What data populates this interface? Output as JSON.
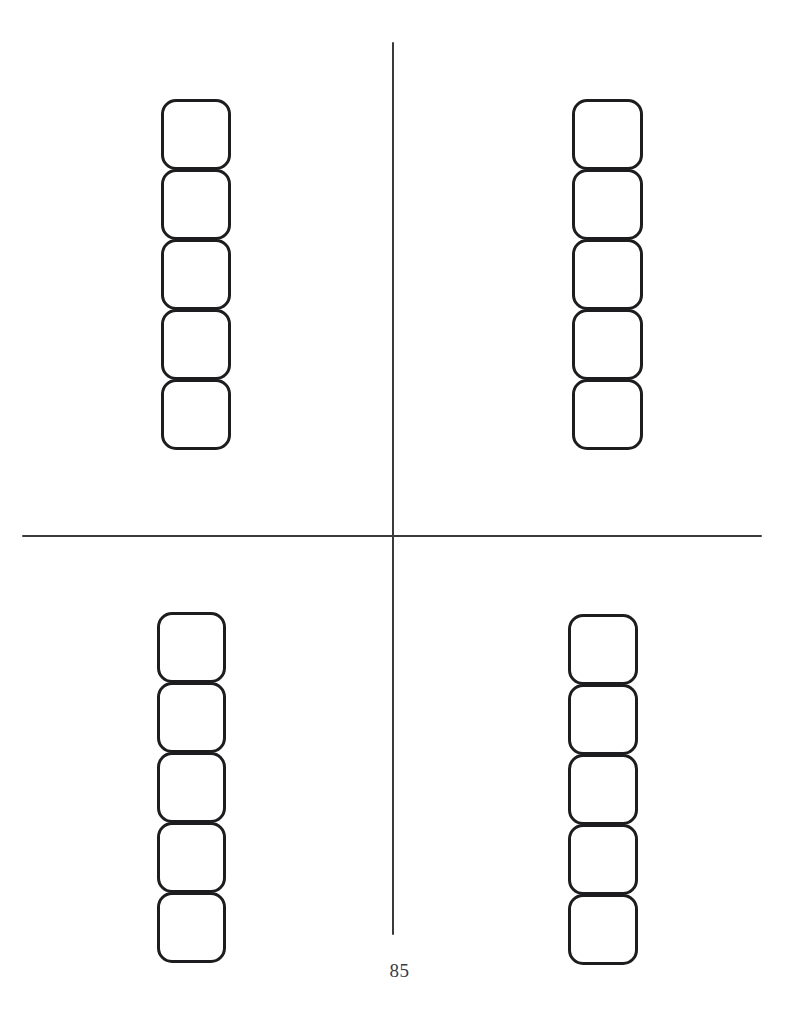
{
  "page": {
    "number": "85",
    "width": 799,
    "height": 1027,
    "background_color": "#ffffff"
  },
  "worksheet": {
    "type": "blank-answer-grid",
    "line_color": "#3a3a3c",
    "box_border_color": "#1d1d1f",
    "box_fill_color": "#ffffff",
    "divider_lines": [
      {
        "name": "vertical-divider",
        "orientation": "vertical",
        "x": 392,
        "y_start": 42,
        "y_end": 935
      },
      {
        "name": "horizontal-divider",
        "orientation": "horizontal",
        "y": 535,
        "x_start": 22,
        "x_end": 762
      }
    ],
    "quadrants": [
      {
        "name": "top-left",
        "box_count": 5,
        "boxes": [
          "",
          "",
          "",
          "",
          ""
        ]
      },
      {
        "name": "top-right",
        "box_count": 5,
        "boxes": [
          "",
          "",
          "",
          "",
          ""
        ]
      },
      {
        "name": "bottom-left",
        "box_count": 5,
        "boxes": [
          "",
          "",
          "",
          "",
          ""
        ]
      },
      {
        "name": "bottom-right",
        "box_count": 5,
        "boxes": [
          "",
          "",
          "",
          "",
          ""
        ]
      }
    ]
  }
}
